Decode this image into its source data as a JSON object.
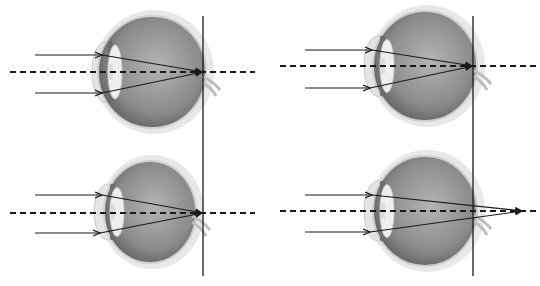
{
  "diagram": {
    "colors": {
      "line": "#1a1a1a",
      "eyeball": "#8a8a8a",
      "sclera": "#d8d8d8",
      "lens": "#eeeeee",
      "background": "#ffffff"
    },
    "reference_lines": [
      {
        "id": "left-retina-line",
        "x": 203,
        "y1": 16,
        "y2": 276
      },
      {
        "id": "right-retina-line",
        "x": 473,
        "y1": 16,
        "y2": 276
      }
    ],
    "panels": [
      {
        "id": "top-left",
        "eye": {
          "cx": 152,
          "cy": 72,
          "rx": 54,
          "ry": 56
        },
        "lens_x": 112,
        "axis": {
          "y": 72,
          "x1": 10,
          "x2": 255
        },
        "rays": [
          {
            "y": 55,
            "x_start": 35,
            "x_lens": 102
          },
          {
            "y": 93,
            "x_start": 35,
            "x_lens": 102
          }
        ],
        "focus": {
          "x": 203,
          "y": 72
        }
      },
      {
        "id": "top-right",
        "eye": {
          "cx": 425,
          "cy": 66,
          "rx": 52,
          "ry": 55
        },
        "lens_x": 384,
        "axis": {
          "y": 66,
          "x1": 280,
          "x2": 536
        },
        "rays": [
          {
            "y": 50,
            "x_start": 305,
            "x_lens": 372
          },
          {
            "y": 88,
            "x_start": 305,
            "x_lens": 370
          }
        ],
        "focus": {
          "x": 473,
          "y": 66
        }
      },
      {
        "id": "bottom-left",
        "eye": {
          "cx": 150,
          "cy": 212,
          "rx": 46,
          "ry": 51
        },
        "lens_x": 114,
        "axis": {
          "y": 213,
          "x1": 10,
          "x2": 255
        },
        "rays": [
          {
            "y": 195,
            "x_start": 35,
            "x_lens": 102
          },
          {
            "y": 233,
            "x_start": 35,
            "x_lens": 100
          }
        ],
        "focus": {
          "x": 203,
          "y": 213
        }
      },
      {
        "id": "bottom-right",
        "eye": {
          "cx": 425,
          "cy": 211,
          "rx": 52,
          "ry": 55
        },
        "lens_x": 384,
        "axis": {
          "y": 211,
          "x1": 280,
          "x2": 536
        },
        "rays": [
          {
            "y": 195,
            "x_start": 305,
            "x_lens": 372
          },
          {
            "y": 232,
            "x_start": 305,
            "x_lens": 370
          }
        ],
        "focus": {
          "x": 523,
          "y": 211
        }
      }
    ]
  }
}
